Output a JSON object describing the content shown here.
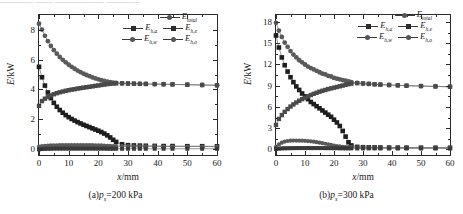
{
  "top_strip_text": "———— —— —————— ————",
  "axis_titles": {
    "y": "E",
    "y_unit": "/kW",
    "x": "x",
    "x_unit": "/mm"
  },
  "legend": {
    "entries": [
      {
        "label": "E",
        "sub": "total",
        "marker": "dot",
        "name": "legend-e-total"
      },
      {
        "label": "E",
        "sub": "h,a",
        "marker": "square",
        "name": "legend-e-h-a"
      },
      {
        "label": "E",
        "sub": "h,e",
        "marker": "square",
        "name": "legend-e-h-e"
      },
      {
        "label": "E",
        "sub": "h,w",
        "marker": "dot",
        "name": "legend-e-h-w"
      },
      {
        "label": "E",
        "sub": "h,o",
        "marker": "dot",
        "name": "legend-e-h-o"
      }
    ]
  },
  "panels": [
    {
      "id": "a",
      "caption_prefix": "(a)",
      "caption_symbol": "p",
      "caption_sub": "s",
      "caption_value": "=200 kPa"
    },
    {
      "id": "b",
      "caption_prefix": "(b)",
      "caption_symbol": "p",
      "caption_sub": "s",
      "caption_value": "=300 kPa"
    }
  ],
  "chart_data": [
    {
      "type": "line",
      "panel": "a",
      "title": "(a) ps=200 kPa",
      "xlabel": "x/mm",
      "ylabel": "E/kW",
      "xlim": [
        0,
        60
      ],
      "ylim": [
        -0.4,
        9.0
      ],
      "xticks": [
        0,
        10,
        20,
        30,
        40,
        50,
        60
      ],
      "yticks": [
        0,
        2,
        4,
        6,
        8
      ],
      "grid": false,
      "legend_position": "top-right",
      "x": [
        0,
        1,
        2,
        3,
        4,
        5,
        6,
        7,
        8,
        9,
        10,
        11,
        12,
        13,
        14,
        15,
        16,
        17,
        18,
        19,
        20,
        21,
        22,
        23,
        24,
        25,
        26,
        28,
        30,
        32,
        34,
        36,
        39,
        42,
        45,
        50,
        55,
        60
      ],
      "series": [
        {
          "name": "E_total",
          "values": [
            8.42,
            8.02,
            7.6,
            7.24,
            6.92,
            6.64,
            6.4,
            6.18,
            5.99,
            5.82,
            5.66,
            5.52,
            5.39,
            5.27,
            5.16,
            5.06,
            4.97,
            4.89,
            4.81,
            4.74,
            4.68,
            4.62,
            4.57,
            4.53,
            4.49,
            4.46,
            4.44,
            4.41,
            4.4,
            4.39,
            4.38,
            4.37,
            4.36,
            4.35,
            4.34,
            4.32,
            4.3,
            4.28
          ]
        },
        {
          "name": "E_h,a",
          "values": [
            5.52,
            4.82,
            4.26,
            3.8,
            3.42,
            3.1,
            2.84,
            2.62,
            2.44,
            2.28,
            2.14,
            2.02,
            1.91,
            1.81,
            1.72,
            1.63,
            1.55,
            1.47,
            1.39,
            1.31,
            1.23,
            1.14,
            1.04,
            0.92,
            0.78,
            0.62,
            0.48,
            0.32,
            0.26,
            0.24,
            0.23,
            0.22,
            0.21,
            0.2,
            0.2,
            0.19,
            0.19,
            0.18
          ]
        },
        {
          "name": "E_h,e",
          "values": [
            2.9,
            3.22,
            3.38,
            3.5,
            3.6,
            3.68,
            3.75,
            3.81,
            3.86,
            3.91,
            3.95,
            3.99,
            4.02,
            4.06,
            4.09,
            4.12,
            4.15,
            4.18,
            4.21,
            4.24,
            4.27,
            4.3,
            4.33,
            4.36,
            4.38,
            4.4,
            4.41,
            4.41,
            4.4,
            4.39,
            4.38,
            4.37,
            4.36,
            4.35,
            4.34,
            4.32,
            4.3,
            4.28
          ]
        },
        {
          "name": "E_h,w",
          "values": [
            0.16,
            0.2,
            0.22,
            0.23,
            0.24,
            0.25,
            0.25,
            0.26,
            0.26,
            0.26,
            0.26,
            0.26,
            0.26,
            0.26,
            0.26,
            0.26,
            0.26,
            0.26,
            0.26,
            0.25,
            0.25,
            0.24,
            0.23,
            0.22,
            0.21,
            0.2,
            0.2,
            0.19,
            0.19,
            0.18,
            0.18,
            0.18,
            0.18,
            0.17,
            0.17,
            0.17,
            0.17,
            0.16
          ]
        },
        {
          "name": "E_h,o",
          "values": [
            -0.02,
            0.0,
            0.01,
            0.02,
            0.02,
            0.03,
            0.03,
            0.03,
            0.03,
            0.03,
            0.03,
            0.03,
            0.03,
            0.03,
            0.03,
            0.03,
            0.03,
            0.03,
            0.03,
            0.03,
            0.03,
            0.03,
            0.03,
            0.02,
            0.02,
            0.02,
            0.02,
            0.02,
            0.02,
            0.02,
            0.02,
            0.02,
            0.02,
            0.02,
            0.02,
            0.02,
            0.02,
            0.02
          ]
        }
      ]
    },
    {
      "type": "line",
      "panel": "b",
      "title": "(b) ps=300 kPa",
      "xlabel": "x/mm",
      "ylabel": "E/kW",
      "xlim": [
        0,
        60
      ],
      "ylim": [
        -0.8,
        19.0
      ],
      "xticks": [
        0,
        10,
        20,
        30,
        40,
        50,
        60
      ],
      "yticks": [
        0,
        3,
        6,
        9,
        12,
        15,
        18
      ],
      "grid": false,
      "legend_position": "top-right",
      "x": [
        0,
        1,
        2,
        3,
        4,
        5,
        6,
        7,
        8,
        9,
        10,
        11,
        12,
        13,
        14,
        15,
        16,
        17,
        18,
        19,
        20,
        21,
        22,
        23,
        24,
        25,
        26,
        28,
        30,
        32,
        34,
        36,
        39,
        42,
        45,
        50,
        55,
        60
      ],
      "series": [
        {
          "name": "E_total",
          "values": [
            17.9,
            16.8,
            15.9,
            15.1,
            14.5,
            13.9,
            13.4,
            13.0,
            12.6,
            12.3,
            12.0,
            11.7,
            11.5,
            11.3,
            11.1,
            10.9,
            10.7,
            10.6,
            10.4,
            10.3,
            10.1,
            10.0,
            9.9,
            9.8,
            9.7,
            9.6,
            9.5,
            9.4,
            9.3,
            9.25,
            9.2,
            9.15,
            9.1,
            9.05,
            9.0,
            8.95,
            8.9,
            8.85
          ]
        },
        {
          "name": "E_h,a",
          "values": [
            16.1,
            14.4,
            13.0,
            11.9,
            11.0,
            10.2,
            9.5,
            8.9,
            8.4,
            7.9,
            7.5,
            7.1,
            6.7,
            6.4,
            6.1,
            5.8,
            5.5,
            5.2,
            4.9,
            4.6,
            4.2,
            3.8,
            3.3,
            2.6,
            1.8,
            1.0,
            0.55,
            0.35,
            0.3,
            0.28,
            0.27,
            0.26,
            0.25,
            0.24,
            0.24,
            0.23,
            0.22,
            0.22
          ]
        },
        {
          "name": "E_h,e",
          "values": [
            3.45,
            4.3,
            4.85,
            5.3,
            5.7,
            6.05,
            6.35,
            6.62,
            6.87,
            7.1,
            7.3,
            7.5,
            7.68,
            7.85,
            8.0,
            8.15,
            8.28,
            8.4,
            8.52,
            8.62,
            8.72,
            8.82,
            8.92,
            9.02,
            9.12,
            9.22,
            9.3,
            9.36,
            9.32,
            9.26,
            9.2,
            9.16,
            9.1,
            9.05,
            9.0,
            8.95,
            8.9,
            8.85
          ]
        },
        {
          "name": "E_h,w",
          "values": [
            0.35,
            0.7,
            0.95,
            1.1,
            1.18,
            1.22,
            1.24,
            1.24,
            1.23,
            1.22,
            1.2,
            1.17,
            1.13,
            1.08,
            1.02,
            0.95,
            0.87,
            0.79,
            0.7,
            0.62,
            0.54,
            0.47,
            0.41,
            0.36,
            0.33,
            0.31,
            0.3,
            0.29,
            0.28,
            0.28,
            0.27,
            0.27,
            0.26,
            0.26,
            0.26,
            0.25,
            0.25,
            0.25
          ]
        },
        {
          "name": "E_h,o",
          "values": [
            0.05,
            0.1,
            0.13,
            0.15,
            0.16,
            0.17,
            0.17,
            0.18,
            0.18,
            0.18,
            0.18,
            0.18,
            0.18,
            0.18,
            0.18,
            0.18,
            0.18,
            0.17,
            0.17,
            0.17,
            0.16,
            0.16,
            0.15,
            0.15,
            0.14,
            0.14,
            0.14,
            0.13,
            0.13,
            0.13,
            0.13,
            0.12,
            0.12,
            0.12,
            0.12,
            0.12,
            0.12,
            0.12
          ]
        }
      ]
    }
  ]
}
